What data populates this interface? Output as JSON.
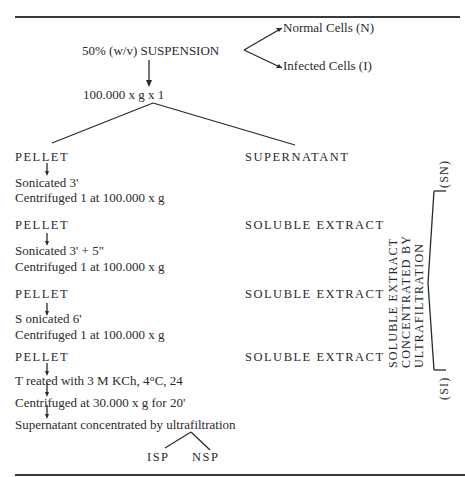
{
  "diagram": {
    "start": {
      "label": "50% (w/v)  SUSPENSION",
      "branches": [
        "Normal Cells  (N)",
        "Infected Cells (I)"
      ]
    },
    "centrifuge_first": "100.000 x g x 1",
    "split": {
      "left": "PELLET",
      "right": "SUPERNATANT"
    },
    "steps": [
      {
        "pellet": "PELLET",
        "treatments": [
          "Sonicated 3'",
          "Centrifuged 1 at 100.000 x g"
        ],
        "extract": "SOLUBLE EXTRACT"
      },
      {
        "pellet": "PELLET",
        "treatments": [
          "Sonicated 3' + 5\"",
          "Centrifuged 1 at 100.000 x g"
        ],
        "extract": "SOLUBLE EXTRACT"
      },
      {
        "pellet": "PELLET",
        "treatments": [
          "S onicated 6'",
          "Centrifuged 1 at 100.000 x g"
        ],
        "extract": "SOLUBLE EXTRACT"
      },
      {
        "pellet": "PELLET",
        "treatments": [
          "T reated with 3 M KCh, 4°C, 24",
          "Centrifuged at 30.000 x g for 20'",
          "Supernatant concentrated by ultrafiltration"
        ],
        "extract": "SOLUBLE EXTRACT"
      }
    ],
    "final_products": [
      "ISP",
      "NSP"
    ],
    "side_process": {
      "lines": [
        "SOLUBLE  EXTRACT",
        "CONCENTRATED  BY",
        "ULTRAFILTRATION"
      ],
      "outputs": [
        "(SN)",
        "(SI)"
      ]
    }
  }
}
